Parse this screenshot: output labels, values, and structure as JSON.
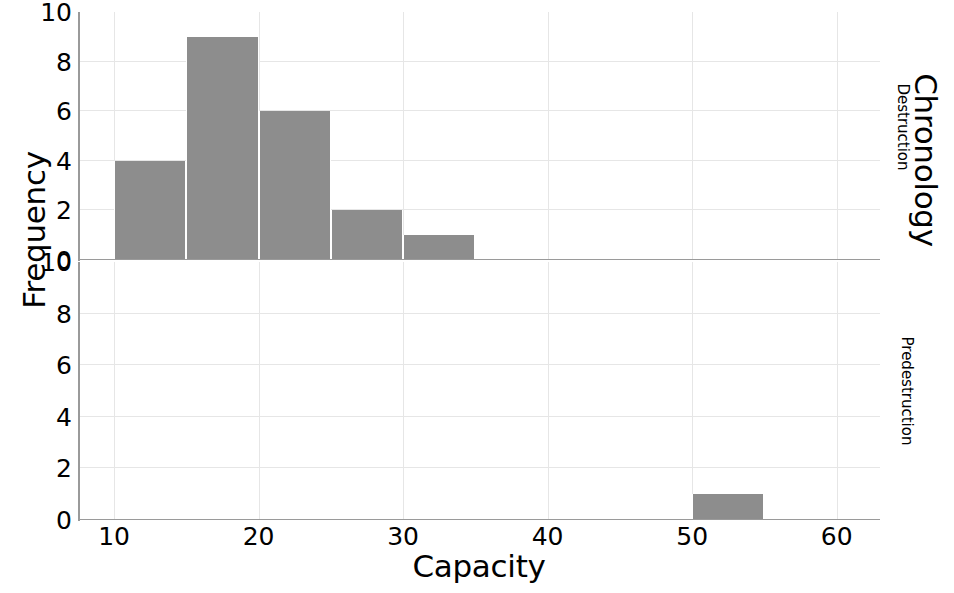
{
  "chart_data": {
    "type": "bar",
    "title": "",
    "xlabel": "Capacity",
    "ylabel": "Frequency",
    "right_label": "Chronology",
    "grid": true,
    "legend_position": "none",
    "xlim": [
      7.5,
      63
    ],
    "ylim": [
      0,
      10
    ],
    "xticks": [
      10,
      20,
      30,
      40,
      50,
      60
    ],
    "yticks": [
      0,
      2,
      4,
      6,
      8,
      10
    ],
    "bin_width": 5,
    "bar_color": "#8d8d8d",
    "grid_color": "#e6e6e6",
    "axis_color": "#9a9a9a",
    "panels": [
      {
        "name": "Destruction",
        "bins": [
          {
            "x0": 10,
            "x1": 15,
            "value": 4
          },
          {
            "x0": 15,
            "x1": 20,
            "value": 9
          },
          {
            "x0": 20,
            "x1": 25,
            "value": 6
          },
          {
            "x0": 25,
            "x1": 30,
            "value": 2
          },
          {
            "x0": 30,
            "x1": 35,
            "value": 1
          }
        ]
      },
      {
        "name": "Predestruction",
        "bins": [
          {
            "x0": 50,
            "x1": 55,
            "value": 1
          }
        ]
      }
    ]
  },
  "axes": {
    "y_title": "Frequency",
    "x_title": "Capacity",
    "right_title": "Chronology"
  },
  "panel_labels": {
    "top": "Destruction",
    "bottom": "Predestruction"
  },
  "xticklabels": [
    "10",
    "20",
    "30",
    "40",
    "50",
    "60"
  ],
  "yticklabels_top": [
    "0",
    "2",
    "4",
    "6",
    "8",
    "10"
  ],
  "yticklabels_bottom": [
    "0",
    "2",
    "4",
    "6",
    "8",
    "10"
  ]
}
